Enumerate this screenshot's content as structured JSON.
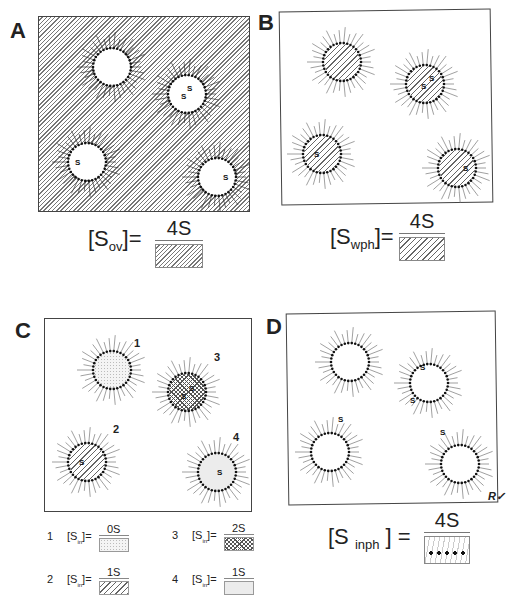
{
  "panels": {
    "A": {
      "label": "A",
      "equation": {
        "lhs": "[S",
        "sub": "ov",
        "rhs": "]=",
        "numerator": "4S",
        "denominator_pattern": "hatched-overall"
      }
    },
    "B": {
      "label": "B",
      "equation": {
        "lhs": "[S",
        "sub": "wph",
        "rhs": "]=",
        "numerator": "4S",
        "denominator_pattern": "hatched-water-phase"
      }
    },
    "C": {
      "label": "C",
      "micelle_numbers": [
        "1",
        "2",
        "3",
        "4"
      ],
      "legend": [
        {
          "n": "1",
          "lhs": "[S",
          "sub": "in",
          "rhs": "]=",
          "numerator": "0S",
          "pattern": "dotted"
        },
        {
          "n": "3",
          "lhs": "[S",
          "sub": "in",
          "rhs": "]=",
          "numerator": "2S",
          "pattern": "cross-hatched"
        },
        {
          "n": "2",
          "lhs": "[S",
          "sub": "in",
          "rhs": "]=",
          "numerator": "1S",
          "pattern": "hatched"
        },
        {
          "n": "4",
          "lhs": "[S",
          "sub": "in",
          "rhs": "]=",
          "numerator": "1S",
          "pattern": "light-grey"
        }
      ]
    },
    "D": {
      "label": "D",
      "equation": {
        "lhs": "[S ",
        "sub": "inph",
        "rhs": " ] =",
        "numerator": "4S",
        "denominator_pattern": "interphase-dots"
      },
      "signature": "R✓"
    },
    "solute_symbol": "S"
  }
}
